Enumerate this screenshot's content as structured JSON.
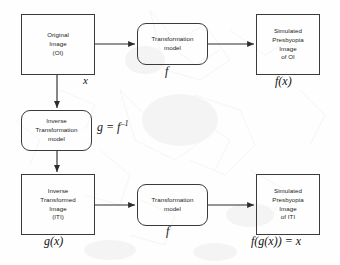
{
  "diagram": {
    "background_color": "#fefefe",
    "stroke_color": "#3a3a3a",
    "text_color": "#1b1b1b",
    "nodes": [
      {
        "id": "original-image",
        "label": "Original\nImage\n(OI)",
        "shape": "rect",
        "math_label": "x"
      },
      {
        "id": "transformation-model-top",
        "label": "Transformation\nmodel",
        "shape": "rounded-rect",
        "math_label": "f"
      },
      {
        "id": "simulated-presbyopia-oi",
        "label": "Simulated\nPresbyopia\nImage\nof OI",
        "shape": "rect",
        "math_label": "f(x)"
      },
      {
        "id": "inverse-transformation-model",
        "label": "Inverse\nTransformation\nmodel",
        "shape": "rounded-rect",
        "math_label": "g = f⁻¹"
      },
      {
        "id": "inverse-transformed-image",
        "label": "Inverse\nTransformed\nImage\n(ITI)",
        "shape": "rect",
        "math_label": "g(x)"
      },
      {
        "id": "transformation-model-bottom",
        "label": "Transformation\nmodel",
        "shape": "rounded-rect",
        "math_label": "f"
      },
      {
        "id": "simulated-presbyopia-iti",
        "label": "Simulated\nPresbyopia\nImage\nof ITI",
        "shape": "rect",
        "math_label": "f(g(x)) = x"
      }
    ],
    "math": {
      "x": "x",
      "f_top": "f",
      "fx": "f(x)",
      "g_equals_f_inverse_base": "g = f",
      "g_equals_f_inverse_exponent": "–1",
      "gx": "g(x)",
      "f_bottom": "f",
      "fgx": "f(g(x)) = x"
    },
    "edges": [
      {
        "id": "oi-to-transformation",
        "from": "original-image",
        "to": "transformation-model-top",
        "direction": "right"
      },
      {
        "id": "transformation-to-simulated-oi",
        "from": "transformation-model-top",
        "to": "simulated-presbyopia-oi",
        "direction": "right"
      },
      {
        "id": "oi-to-inverse-model",
        "from": "original-image",
        "to": "inverse-transformation-model",
        "direction": "down"
      },
      {
        "id": "inverse-model-to-iti",
        "from": "inverse-transformation-model",
        "to": "inverse-transformed-image",
        "direction": "down"
      },
      {
        "id": "iti-to-transformation",
        "from": "inverse-transformed-image",
        "to": "transformation-model-bottom",
        "direction": "right"
      },
      {
        "id": "transformation-to-simulated-iti",
        "from": "transformation-model-bottom",
        "to": "simulated-presbyopia-iti",
        "direction": "right"
      }
    ]
  }
}
